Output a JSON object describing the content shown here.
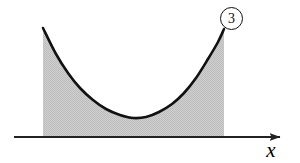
{
  "figure": {
    "background_color": "#ffffff",
    "curve_color": "#111111",
    "fill_color": "#c9c9c9",
    "axis_color": "#222222"
  },
  "axes": {
    "x_axis_label": "x",
    "x_axis_start_px": 14,
    "x_axis_end_px": 280,
    "x_axis_y_px": 137,
    "has_arrowhead": true
  },
  "callout": {
    "label": "3",
    "shape": "circle"
  },
  "chart_data": {
    "type": "area",
    "title": "",
    "xlabel": "x",
    "ylabel": "",
    "grid": false,
    "legend": null,
    "curve_points_px": [
      [
        43,
        28
      ],
      [
        56,
        54
      ],
      [
        68,
        73
      ],
      [
        80,
        88
      ],
      [
        93,
        100
      ],
      [
        106,
        109
      ],
      [
        120,
        115
      ],
      [
        133,
        118
      ],
      [
        146,
        117
      ],
      [
        159,
        112
      ],
      [
        172,
        104
      ],
      [
        184,
        93
      ],
      [
        196,
        78
      ],
      [
        208,
        59
      ],
      [
        218,
        42
      ],
      [
        224,
        29
      ]
    ],
    "fill_baseline_y_px": 137,
    "fill_left_x_px": 43,
    "fill_right_x_px": 224,
    "annotations": [
      {
        "text": "3",
        "kind": "circled-callout",
        "x_px": 231,
        "y_px": 18
      }
    ]
  }
}
